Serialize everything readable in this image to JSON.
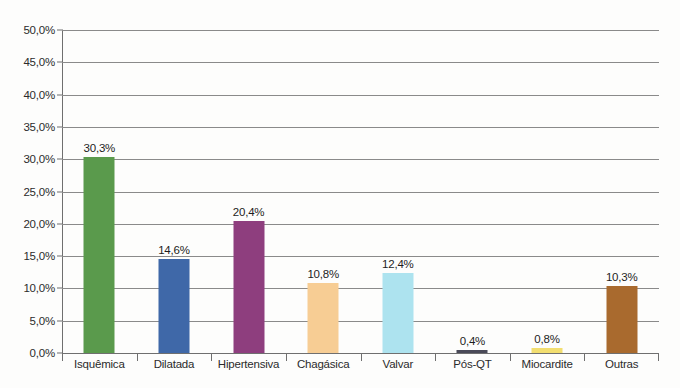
{
  "chart_data": {
    "type": "bar",
    "title": "",
    "subtitle": "",
    "xlabel": "",
    "ylabel": "",
    "categories": [
      "Isquêmica",
      "Dilatada",
      "Hipertensiva",
      "Chagásica",
      "Valvar",
      "Pós-QT",
      "Miocardite",
      "Outras"
    ],
    "values": [
      30.3,
      14.6,
      20.4,
      10.8,
      12.4,
      0.4,
      0.8,
      10.3
    ],
    "value_labels": [
      "30,3%",
      "14,6%",
      "20,4%",
      "10,8%",
      "12,4%",
      "0,4%",
      "0,8%",
      "10,3%"
    ],
    "bar_colors": [
      "#5a9a4c",
      "#3f68a8",
      "#8e3e7e",
      "#f7cd94",
      "#ade3ef",
      "#4a4a58",
      "#f2de70",
      "#a96a2e"
    ],
    "ylim": [
      0,
      50
    ],
    "ytick_values": [
      0,
      5,
      10,
      15,
      20,
      25,
      30,
      35,
      40,
      45,
      50
    ],
    "ytick_labels": [
      "0,0%",
      "5,0%",
      "10,0%",
      "15,0%",
      "20,0%",
      "25,0%",
      "30,0%",
      "35,0%",
      "40,0%",
      "45,0%",
      "50,0%"
    ],
    "grid": true,
    "legend": "none",
    "decimal_separator": ",",
    "axis_color": "#6f6f6f",
    "grid_color": "#8a8a8a",
    "background": "#fdfdfc"
  }
}
